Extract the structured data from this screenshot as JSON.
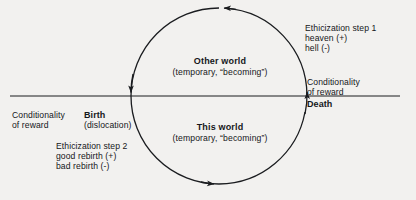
{
  "diagram": {
    "colors": {
      "ink": "#15171a",
      "background": "#f2f1ef",
      "line": "#1a1c1f"
    },
    "axis": {
      "name": "horizontal-divider",
      "x_start": 10,
      "x_end": 400,
      "y": 96
    },
    "circle": {
      "center_x": 219,
      "center_y": 96,
      "radius": 88,
      "direction": "counterclockwise"
    },
    "regions": {
      "upper": {
        "title": "Other world",
        "subtitle": "(temporary, “becoming”)"
      },
      "lower": {
        "title": "This world",
        "subtitle": "(temporary, “becoming”)"
      }
    },
    "crossings": {
      "left": {
        "label": "Birth",
        "sublabel": "(dislocation)",
        "arrow_direction": "down"
      },
      "right": {
        "label": "Death",
        "arrow_direction": "up"
      }
    },
    "annotations": {
      "ethicization_step_1": {
        "heading": "Ethicization step 1",
        "lines": [
          "heaven (+)",
          "hell (-)"
        ]
      },
      "ethicization_step_2": {
        "heading": "Ethicization step 2",
        "lines": [
          "good rebirth (+)",
          "bad rebirth (-)"
        ]
      },
      "conditionality_right": {
        "line1": "Conditionality",
        "line2": "of reward"
      },
      "conditionality_left": {
        "line1": "Conditionality",
        "line2": "of reward"
      }
    },
    "arrows": {
      "top_arc": "points-left",
      "bottom_arc": "points-right"
    }
  }
}
